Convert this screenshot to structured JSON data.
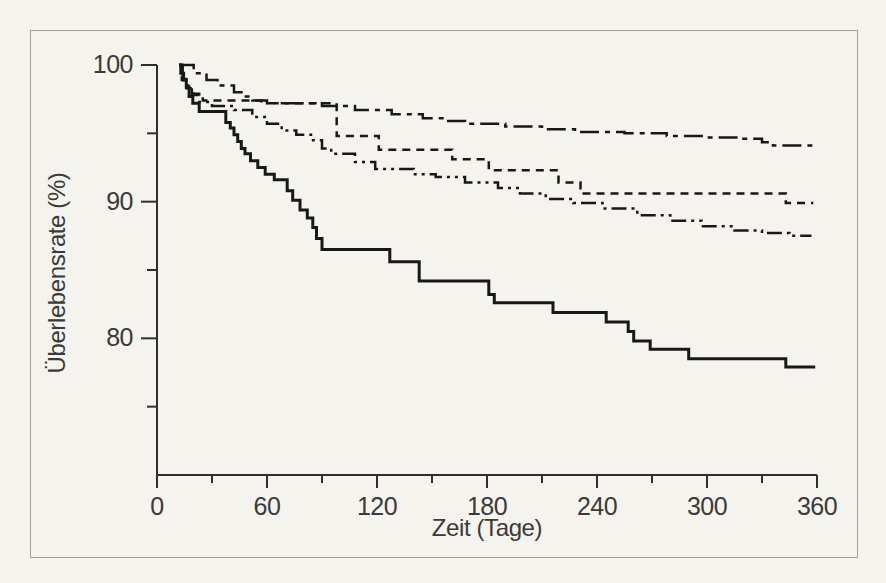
{
  "figure": {
    "background_color": "#f5f3ee",
    "border_color": "#a29e96",
    "text_color": "#3a3a3a",
    "curve_color": "#181818",
    "axis_color": "#2e2e2e"
  },
  "chart_data": {
    "type": "line",
    "subtype": "kaplan-meier-step-curves",
    "title": "",
    "xlabel": "Zeit (Tage)",
    "ylabel": "Überlebensrate (%)",
    "xlim": [
      0,
      360
    ],
    "ylim": [
      70,
      100
    ],
    "x_ticks_major": [
      0,
      60,
      120,
      180,
      240,
      300,
      360
    ],
    "x_ticks_minor": [
      30,
      90,
      150,
      210,
      270,
      330
    ],
    "y_ticks_major": [
      100,
      90,
      80
    ],
    "y_ticks_minor": [
      95,
      85,
      75
    ],
    "grid": false,
    "legend_position": "none",
    "series": [
      {
        "name": "curve-solid",
        "style": "solid",
        "end_day": 359,
        "points": [
          [
            12,
            100
          ],
          [
            13,
            99.4
          ],
          [
            14.5,
            98.9
          ],
          [
            16,
            98.4
          ],
          [
            17.5,
            97.7
          ],
          [
            19.5,
            97.2
          ],
          [
            23,
            96.6
          ],
          [
            37.5,
            95.8
          ],
          [
            40,
            95.4
          ],
          [
            42,
            94.9
          ],
          [
            44,
            94.4
          ],
          [
            46,
            93.9
          ],
          [
            48,
            93.5
          ],
          [
            51,
            93.0
          ],
          [
            55,
            92.5
          ],
          [
            59,
            92.0
          ],
          [
            64,
            91.6
          ],
          [
            71,
            90.8
          ],
          [
            74,
            90.1
          ],
          [
            78,
            89.4
          ],
          [
            82,
            88.8
          ],
          [
            85,
            88.1
          ],
          [
            87,
            87.3
          ],
          [
            90,
            86.5
          ],
          [
            127,
            85.6
          ],
          [
            143,
            84.2
          ],
          [
            181,
            83.2
          ],
          [
            184,
            82.6
          ],
          [
            216,
            81.9
          ],
          [
            245,
            81.2
          ],
          [
            257,
            80.5
          ],
          [
            260,
            79.8
          ],
          [
            269,
            79.2
          ],
          [
            290,
            78.5
          ],
          [
            343,
            77.9
          ]
        ]
      },
      {
        "name": "curve-dash-dot",
        "style": "dash-dot",
        "end_day": 360,
        "points": [
          [
            12,
            100
          ],
          [
            20,
            99.4
          ],
          [
            27,
            98.9
          ],
          [
            33,
            98.5
          ],
          [
            42,
            98.0
          ],
          [
            47,
            97.7
          ],
          [
            52,
            97.4
          ],
          [
            60,
            97.2
          ],
          [
            90,
            97.0
          ],
          [
            108,
            96.7
          ],
          [
            128,
            96.4
          ],
          [
            145,
            96.1
          ],
          [
            157,
            95.9
          ],
          [
            168,
            95.7
          ],
          [
            190,
            95.5
          ],
          [
            210,
            95.3
          ],
          [
            228,
            95.1
          ],
          [
            255,
            95.0
          ],
          [
            278,
            94.8
          ],
          [
            300,
            94.7
          ],
          [
            318,
            94.6
          ],
          [
            330,
            94.35
          ],
          [
            336,
            94.1
          ]
        ]
      },
      {
        "name": "curve-dashed",
        "style": "dashed",
        "end_day": 358,
        "points": [
          [
            12,
            100
          ],
          [
            13.5,
            98.9
          ],
          [
            16,
            98.3
          ],
          [
            20,
            97.8
          ],
          [
            25,
            97.4
          ],
          [
            57,
            97.2
          ],
          [
            98,
            94.8
          ],
          [
            121,
            93.8
          ],
          [
            161,
            93.1
          ],
          [
            181,
            92.3
          ],
          [
            219,
            91.4
          ],
          [
            231,
            90.6
          ],
          [
            343,
            89.9
          ]
        ]
      },
      {
        "name": "curve-dash-dot-dot",
        "style": "dash-dot-dot",
        "end_day": 357,
        "points": [
          [
            12,
            100
          ],
          [
            14,
            99.2
          ],
          [
            16,
            98.5
          ],
          [
            19,
            97.9
          ],
          [
            23,
            97.3
          ],
          [
            30,
            97.0
          ],
          [
            42,
            96.7
          ],
          [
            52,
            96.2
          ],
          [
            60,
            95.7
          ],
          [
            68,
            95.2
          ],
          [
            76,
            94.9
          ],
          [
            84,
            94.5
          ],
          [
            90,
            93.9
          ],
          [
            95,
            93.5
          ],
          [
            108,
            92.9
          ],
          [
            119,
            92.4
          ],
          [
            140,
            92.0
          ],
          [
            152,
            91.8
          ],
          [
            168,
            91.4
          ],
          [
            186,
            91.0
          ],
          [
            198,
            90.6
          ],
          [
            212,
            90.2
          ],
          [
            227,
            89.9
          ],
          [
            243,
            89.5
          ],
          [
            262,
            89.0
          ],
          [
            280,
            88.6
          ],
          [
            297,
            88.2
          ],
          [
            315,
            87.9
          ],
          [
            330,
            87.7
          ],
          [
            345,
            87.5
          ]
        ]
      }
    ]
  }
}
